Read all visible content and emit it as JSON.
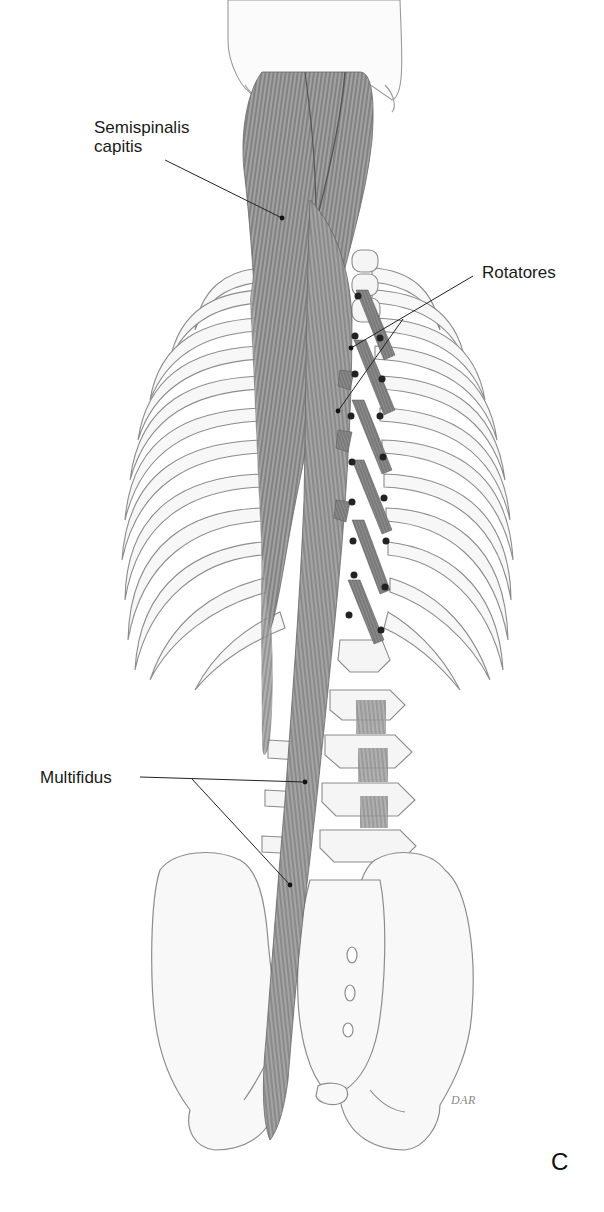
{
  "figure": {
    "type": "anatomical illustration",
    "view": "posterior view of trunk, deep back muscles",
    "panel_letter": "C",
    "signature": "DAR",
    "colors": {
      "bone_outline": "#8c8c8c",
      "bone_fill": "#f7f7f7",
      "muscle": "#7a7a7a",
      "muscle_dark": "#555555",
      "leader_line": "#222222",
      "label_text": "#1a1a1a"
    }
  },
  "labels": [
    {
      "id": "semispinalis-capitis",
      "lines": [
        "Semispinalis",
        "capitis"
      ],
      "text_position": [
        94,
        118
      ],
      "leader_from": [
        163,
        160
      ],
      "leader_to": [
        [
          282,
          218
        ]
      ]
    },
    {
      "id": "rotatores",
      "lines": [
        "Rotatores"
      ],
      "text_position": [
        482,
        262
      ],
      "leader_from": [
        473,
        276
      ],
      "leader_to": [
        [
          351,
          348
        ],
        [
          338,
          411
        ]
      ]
    },
    {
      "id": "multifidus",
      "lines": [
        "Multifidus"
      ],
      "text_position": [
        40,
        768
      ],
      "leader_from": [
        140,
        778
      ],
      "leader_to": [
        [
          305,
          782
        ],
        [
          290,
          885
        ]
      ]
    }
  ],
  "legend_text": {
    "semispinalis_line1": "Semispinalis",
    "semispinalis_line2": "capitis",
    "rotatores": "Rotatores",
    "multifidus": "Multifidus"
  }
}
